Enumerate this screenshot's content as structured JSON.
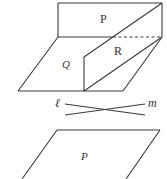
{
  "figure": {
    "top_diagram": {
      "labels": {
        "plane_p": "P",
        "plane_q": "Q",
        "plane_r": "R"
      }
    },
    "middle_diagram": {
      "labels": {
        "line_l": "ℓ",
        "line_m": "m"
      }
    },
    "bottom_diagram": {
      "labels": {
        "plane_p": "P"
      }
    },
    "colors": {
      "stroke": "#3a3a3a",
      "background": "#ffffff"
    }
  }
}
